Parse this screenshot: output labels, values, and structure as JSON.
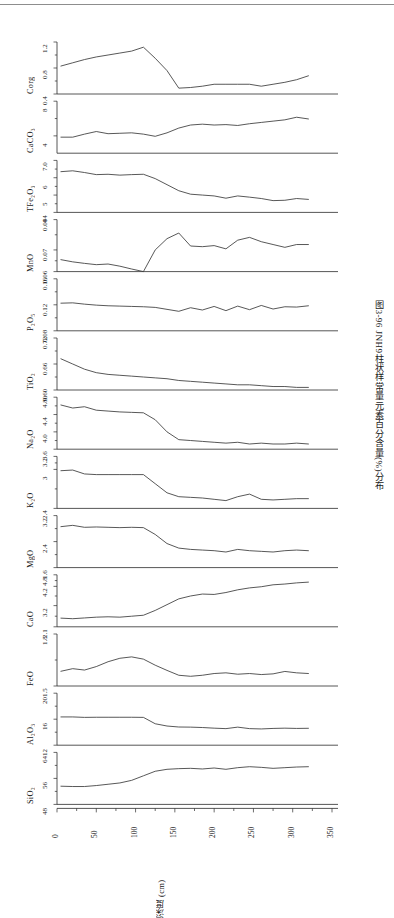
{
  "figure": {
    "caption": "图3-96  JNH9柱状样常量元素百分含量(%)分布",
    "xaxis_label": "深度 (cm)",
    "xaxis_ticks": [
      "0",
      "50",
      "100",
      "150",
      "200",
      "250",
      "300",
      "350"
    ],
    "xaxis_range": [
      0,
      350
    ]
  },
  "chart_data": {
    "type": "line",
    "title": "图3-96  JNH9柱状样常量元素百分含量(%)分布",
    "xlabel": "深度 (cm)",
    "ylabel": "含量 (%)",
    "xlim": [
      0,
      350
    ],
    "grid": false,
    "legend": "none",
    "x": [
      5,
      20,
      35,
      50,
      65,
      80,
      95,
      110,
      125,
      140,
      155,
      170,
      185,
      200,
      215,
      230,
      245,
      260,
      275,
      290,
      305,
      320
    ],
    "panels": [
      {
        "name": "Corg",
        "label": "Corg",
        "ylim": [
          0.4,
          1.2
        ],
        "yticks": [
          "1.2",
          "0.8",
          "0.4"
        ],
        "ytick_values": [
          1.2,
          0.8,
          0.4
        ],
        "values": [
          0.83,
          0.88,
          0.93,
          0.97,
          1.0,
          1.03,
          1.06,
          1.12,
          0.95,
          0.76,
          0.49,
          0.5,
          0.52,
          0.55,
          0.55,
          0.55,
          0.55,
          0.52,
          0.55,
          0.58,
          0.62,
          0.68
        ]
      },
      {
        "name": "CaCO3",
        "label": "CaCO₃",
        "ylim": [
          2,
          8
        ],
        "yticks": [
          "8",
          "4"
        ],
        "ytick_values": [
          8,
          4
        ],
        "values": [
          3.85,
          3.85,
          4.2,
          4.5,
          4.25,
          4.3,
          4.35,
          4.2,
          3.95,
          4.35,
          4.9,
          5.25,
          5.35,
          5.25,
          5.3,
          5.2,
          5.4,
          5.55,
          5.7,
          5.85,
          6.15,
          5.95
        ]
      },
      {
        "name": "TFe2O3",
        "label": "TFe₂O₃",
        "ylim": [
          4,
          7
        ],
        "yticks": [
          "7.0",
          "6",
          "5",
          "4"
        ],
        "ytick_values": [
          7.0,
          6,
          5,
          4
        ],
        "values": [
          6.35,
          6.4,
          6.3,
          6.18,
          6.2,
          6.15,
          6.18,
          6.2,
          5.95,
          5.6,
          5.25,
          5.05,
          5.0,
          4.95,
          4.82,
          4.95,
          4.88,
          4.8,
          4.68,
          4.7,
          4.8,
          4.75
        ]
      },
      {
        "name": "MnO",
        "label": "MnO",
        "ylim": [
          0.06,
          0.084
        ],
        "yticks": [
          "0.084",
          "0.07",
          "0.06"
        ],
        "ytick_values": [
          0.084,
          0.07,
          0.06
        ],
        "values": [
          0.0655,
          0.0645,
          0.0638,
          0.0632,
          0.0635,
          0.0625,
          0.0612,
          0.06,
          0.07,
          0.0752,
          0.0778,
          0.0718,
          0.0715,
          0.072,
          0.0705,
          0.0745,
          0.0758,
          0.0738,
          0.0725,
          0.0712,
          0.0725,
          0.0725
        ]
      },
      {
        "name": "P2O5",
        "label": "P₂O₅",
        "ylim": [
          0.08,
          0.16
        ],
        "yticks": [
          "0.16",
          "0.12",
          "0.08"
        ],
        "ytick_values": [
          0.16,
          0.12,
          0.08
        ],
        "values": [
          0.1225,
          0.123,
          0.121,
          0.1195,
          0.1185,
          0.118,
          0.1175,
          0.117,
          0.116,
          0.113,
          0.11,
          0.1155,
          0.112,
          0.1175,
          0.111,
          0.118,
          0.1125,
          0.119,
          0.1135,
          0.117,
          0.1165,
          0.1185
        ]
      },
      {
        "name": "TiO2",
        "label": "TiO₂",
        "ylim": [
          0.6,
          0.72
        ],
        "yticks": [
          "0.72",
          "0.66",
          "0.60"
        ],
        "ytick_values": [
          0.72,
          0.66,
          0.6
        ],
        "values": [
          0.672,
          0.66,
          0.648,
          0.64,
          0.636,
          0.634,
          0.632,
          0.63,
          0.628,
          0.626,
          0.622,
          0.62,
          0.618,
          0.616,
          0.614,
          0.612,
          0.612,
          0.61,
          0.608,
          0.608,
          0.606,
          0.606
        ]
      },
      {
        "name": "Na2O",
        "label": "Na₂O",
        "ylim": [
          3.6,
          4.8
        ],
        "yticks": [
          "4.80",
          "4.4",
          "4.0",
          "3.6"
        ],
        "ytick_values": [
          4.8,
          4.4,
          4.0,
          3.6
        ],
        "values": [
          4.62,
          4.55,
          4.58,
          4.5,
          4.48,
          4.46,
          4.45,
          4.44,
          4.28,
          4.0,
          3.82,
          3.8,
          3.78,
          3.76,
          3.74,
          3.76,
          3.72,
          3.74,
          3.72,
          3.72,
          3.74,
          3.72
        ]
      },
      {
        "name": "K2O",
        "label": "K₂O",
        "ylim": [
          2.4,
          3.2
        ],
        "yticks": [
          "3.2",
          "3",
          "2.4"
        ],
        "ytick_values": [
          3.2,
          3,
          2.4
        ],
        "values": [
          2.98,
          2.99,
          2.93,
          2.92,
          2.92,
          2.92,
          2.92,
          2.92,
          2.78,
          2.64,
          2.58,
          2.57,
          2.56,
          2.54,
          2.52,
          2.58,
          2.62,
          2.54,
          2.53,
          2.54,
          2.55,
          2.55
        ]
      },
      {
        "name": "MgO",
        "label": "MgO",
        "ylim": [
          1.6,
          3.2
        ],
        "yticks": [
          "3.2",
          "2.4",
          "1.6"
        ],
        "ytick_values": [
          3.2,
          2.4,
          1.6
        ],
        "values": [
          2.86,
          2.9,
          2.84,
          2.85,
          2.84,
          2.83,
          2.84,
          2.83,
          2.62,
          2.34,
          2.2,
          2.16,
          2.14,
          2.12,
          2.08,
          2.16,
          2.12,
          2.1,
          2.08,
          2.12,
          2.14,
          2.12
        ]
      },
      {
        "name": "CaO",
        "label": "CaO",
        "ylim": [
          2.1,
          4.8
        ],
        "yticks": [
          "4.8",
          "4.2",
          "3.2",
          "2.1"
        ],
        "ytick_values": [
          4.8,
          4.2,
          3.2,
          2.1
        ],
        "values": [
          2.55,
          2.52,
          2.56,
          2.6,
          2.62,
          2.6,
          2.65,
          2.7,
          2.95,
          3.25,
          3.55,
          3.7,
          3.8,
          3.78,
          3.88,
          4.02,
          4.12,
          4.18,
          4.28,
          4.32,
          4.38,
          4.42
        ]
      },
      {
        "name": "FeO",
        "label": "FeO",
        "ylim": [
          1.5,
          1.8
        ],
        "yticks": [
          "1.8",
          "1.5"
        ],
        "ytick_values": [
          1.8,
          1.5
        ],
        "values": [
          1.585,
          1.6,
          1.592,
          1.612,
          1.64,
          1.66,
          1.668,
          1.655,
          1.62,
          1.59,
          1.562,
          1.556,
          1.562,
          1.572,
          1.576,
          1.568,
          1.572,
          1.566,
          1.57,
          1.584,
          1.576,
          1.572
        ]
      },
      {
        "name": "Al2O3",
        "label": "Al₂O₃",
        "ylim": [
          12,
          20
        ],
        "yticks": [
          "20",
          "16",
          "12"
        ],
        "ytick_values": [
          20,
          16,
          12
        ],
        "values": [
          16.35,
          16.35,
          16.28,
          16.3,
          16.3,
          16.3,
          16.3,
          16.28,
          15.3,
          14.95,
          14.8,
          14.78,
          14.72,
          14.62,
          14.55,
          14.78,
          14.55,
          14.5,
          14.58,
          14.62,
          14.58,
          14.6
        ]
      },
      {
        "name": "SiO2",
        "label": "SiO₂",
        "ylim": [
          48,
          64
        ],
        "yticks": [
          "64",
          "56",
          "48"
        ],
        "ytick_values": [
          64,
          56,
          48
        ],
        "values": [
          53.6,
          53.5,
          53.5,
          53.8,
          54.2,
          54.6,
          55.4,
          56.8,
          58.2,
          58.8,
          59.0,
          59.1,
          58.9,
          59.2,
          58.8,
          59.3,
          59.6,
          59.4,
          59.1,
          59.3,
          59.5,
          59.6
        ]
      }
    ]
  }
}
